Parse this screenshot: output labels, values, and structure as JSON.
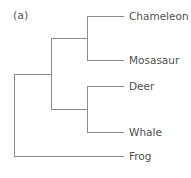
{
  "figure": {
    "panel_label": "(a)",
    "line_color": "#8a8a8a",
    "text_color": "#505050"
  },
  "tree": {
    "topology": "((Chameleon, Mosasaur), (Deer, Whale)), Frog",
    "leaves": [
      {
        "label": "Chameleon",
        "y": 16
      },
      {
        "label": "Mosasaur",
        "y": 60
      },
      {
        "label": "Deer",
        "y": 86
      },
      {
        "label": "Whale",
        "y": 132
      },
      {
        "label": "Frog",
        "y": 156
      }
    ]
  }
}
